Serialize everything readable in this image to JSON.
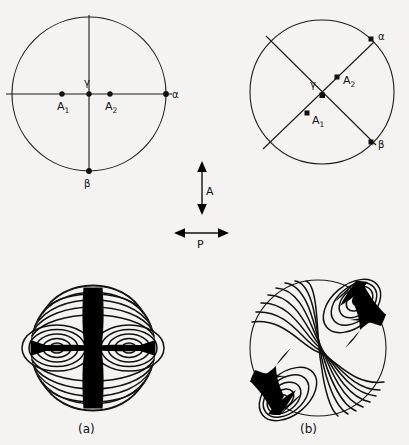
{
  "figure": {
    "caption_a": "(a)",
    "caption_b": "(b)",
    "polarizer_label": "P",
    "analyser_label": "A"
  },
  "panels": {
    "top_left": {
      "name": "optic-axis-orientation-parallel",
      "circle": {
        "cx": 89,
        "cy": 94,
        "r": 77
      },
      "lines": [
        {
          "name": "horizontal-axis",
          "x1": 6,
          "y1": 94,
          "x2": 172,
          "y2": 94
        },
        {
          "name": "vertical-axis",
          "x1": 89,
          "y1": 15,
          "x2": 89,
          "y2": 173
        }
      ],
      "points": [
        {
          "label": "A₁",
          "base": "A",
          "sub": "1",
          "x": 62,
          "y": 94,
          "lx": 57,
          "ly": 108
        },
        {
          "label": "γ",
          "base": "γ",
          "sub": "",
          "x": 89,
          "y": 94,
          "lx": 85,
          "ly": 86
        },
        {
          "label": "A₂",
          "base": "A",
          "sub": "2",
          "x": 110,
          "y": 94,
          "lx": 105,
          "ly": 108
        },
        {
          "label": "α",
          "base": "α",
          "sub": "",
          "x": 166,
          "y": 94,
          "lx": 172,
          "ly": 97
        },
        {
          "label": "β",
          "base": "β",
          "sub": "",
          "x": 89,
          "y": 171,
          "lx": 85,
          "ly": 185
        }
      ]
    },
    "top_right": {
      "name": "optic-axis-orientation-diagonal",
      "circle": {
        "cx": 322,
        "cy": 92,
        "r": 72
      },
      "lines": [
        {
          "name": "chord-alpha-gamma",
          "x1": 374,
          "y1": 42,
          "x2": 264,
          "y2": 148
        },
        {
          "name": "chord-beta-gamma",
          "x1": 267,
          "y1": 37,
          "x2": 375,
          "y2": 144
        }
      ],
      "points": [
        {
          "label": "α",
          "base": "α",
          "sub": "",
          "x": 371,
          "y": 39,
          "lx": 378,
          "ly": 37
        },
        {
          "label": "A₂",
          "base": "A",
          "sub": "2",
          "x": 337,
          "y": 77,
          "lx": 343,
          "ly": 82
        },
        {
          "label": "γ",
          "base": "γ",
          "sub": "",
          "x": 322,
          "y": 95,
          "lx": 315,
          "ly": 87
        },
        {
          "label": "A₁",
          "base": "A",
          "sub": "1",
          "x": 307,
          "y": 113,
          "lx": 312,
          "ly": 121
        },
        {
          "label": "β",
          "base": "β",
          "sub": "",
          "x": 371,
          "y": 142,
          "lx": 378,
          "ly": 148
        }
      ]
    },
    "bottom_left": {
      "name": "interference-figure-parallel-position",
      "circle": {
        "cx": 93,
        "cy": 348,
        "r": 62
      },
      "melatopes": [
        {
          "x": 57,
          "y": 348
        },
        {
          "x": 129,
          "y": 348
        }
      ],
      "isogyre_type": "straight-cross",
      "isogyre_vertical_width": 19,
      "isogyre_horizontal_width": 5
    },
    "bottom_right": {
      "name": "interference-figure-45-degree-position",
      "circle": {
        "cx": 318,
        "cy": 348,
        "r": 68
      },
      "melatopes": [
        {
          "x": 358,
          "y": 300
        },
        {
          "x": 282,
          "y": 400
        }
      ],
      "isogyre_type": "curved-hyperbolic"
    }
  },
  "colors": {
    "background": "#f4f3f1",
    "ink": "#111111",
    "isogyre": "#000000"
  }
}
